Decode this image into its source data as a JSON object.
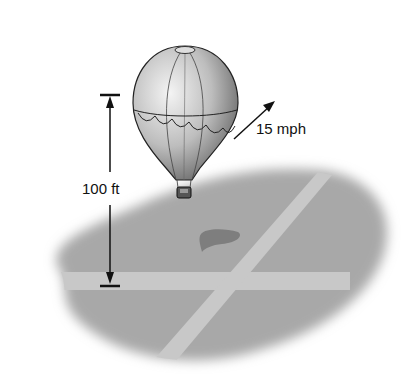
{
  "diagram": {
    "height_label": "100 ft",
    "speed_label": "15 mph",
    "colors": {
      "ground": "#a8a8a8",
      "road": "#c8c8c8",
      "shadow": "#7e7e7e",
      "line": "#111111"
    }
  }
}
